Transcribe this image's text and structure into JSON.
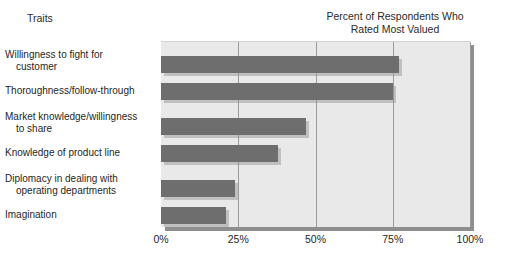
{
  "headings": {
    "traits": "Traits",
    "title_line1": "Percent of Respondents Who",
    "title_line2": "Rated Most Valued"
  },
  "colors": {
    "bar_fill": "#6e6e6e",
    "plot_background": "#e9e9e9",
    "gridline": "#9b9b9b",
    "shadow": "#8e8e8e",
    "text": "#1f1f1f"
  },
  "chart_data": {
    "type": "bar",
    "orientation": "horizontal",
    "title": "Percent of Respondents Who Rated Most Valued",
    "xlabel": "",
    "ylabel": "Traits",
    "xlim": [
      0,
      100
    ],
    "grid": true,
    "legend": "none",
    "tick_labels": [
      "0%",
      "25%",
      "50%",
      "75%",
      "100%"
    ],
    "tick_values": [
      0,
      25,
      50,
      75,
      100
    ],
    "categories": [
      "Willingness to fight for customer",
      "Thoroughness/follow-through",
      "Market knowledge/willingness to share",
      "Knowledge of product line",
      "Diplomacy in dealing with operating departments",
      "Imagination"
    ],
    "values": [
      77,
      75,
      47,
      38,
      24,
      21
    ]
  },
  "category_labels": [
    {
      "line1": "Willingness to fight for",
      "line2": "customer"
    },
    {
      "line1": "Thoroughness/follow-through",
      "line2": ""
    },
    {
      "line1": "Market knowledge/willingness",
      "line2": "to share"
    },
    {
      "line1": "Knowledge of product line",
      "line2": ""
    },
    {
      "line1": "Diplomacy in dealing with",
      "line2": "operating departments"
    },
    {
      "line1": "Imagination",
      "line2": ""
    }
  ]
}
